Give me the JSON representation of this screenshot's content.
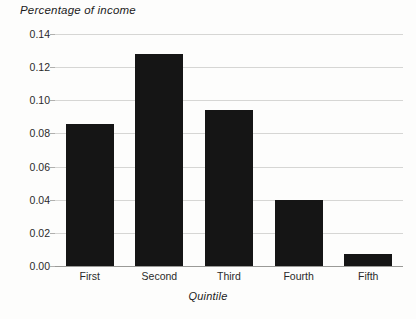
{
  "chart_data": {
    "type": "bar",
    "title": "Percentage of income",
    "xlabel": "Quintile",
    "ylabel": "Percentage of income",
    "categories": [
      "First",
      "Second",
      "Third",
      "Fourth",
      "Fifth"
    ],
    "values": [
      0.086,
      0.128,
      0.094,
      0.04,
      0.007
    ],
    "ylim": [
      0.0,
      0.14
    ],
    "ytick_step": 0.02,
    "ytick_labels": [
      "0.00",
      "0.02",
      "0.04",
      "0.06",
      "0.08",
      "0.10",
      "0.12",
      "0.14"
    ],
    "ytick_values": [
      0.0,
      0.02,
      0.04,
      0.06,
      0.08,
      0.1,
      0.12,
      0.14
    ],
    "grid": true,
    "legend": false,
    "bar_color": "#151515",
    "gridline_color": "#d6d6d4",
    "axis_color": "#9a9a97",
    "background_color": "#fdfdfc"
  }
}
